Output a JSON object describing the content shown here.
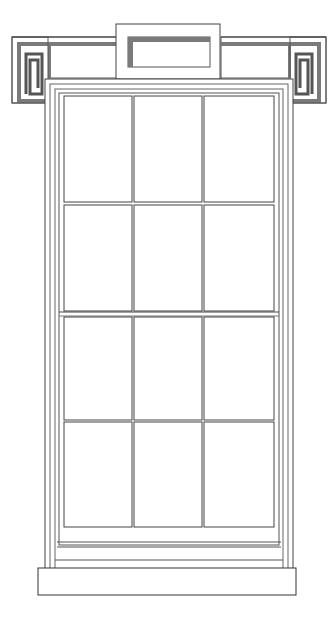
{
  "colors": {
    "background": "#ffffff",
    "line": "#3a3a3a",
    "light_line": "#6e6e6e",
    "shade": "#7a7a7a"
  },
  "drawing": {
    "type": "architectural elevation",
    "subject": "double-hung sash window",
    "lintel": {
      "ornament": "greek key (meander) corner blocks",
      "center_block": "raised rectangular keystone tablet"
    },
    "sash": {
      "columns": 3,
      "rows": 4,
      "total_panes": 12,
      "meeting_rail_after_row": 2
    },
    "sill": "projecting stone sill"
  }
}
